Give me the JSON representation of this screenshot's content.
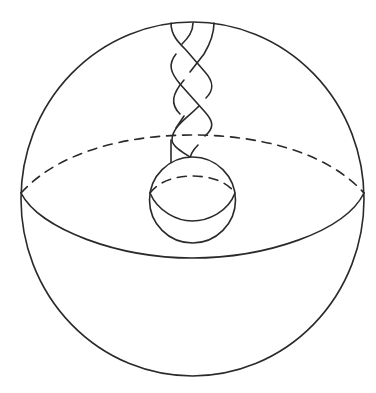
{
  "figure": {
    "colors": {
      "stroke": "#2a2a2a",
      "background": "#ffffff"
    },
    "outer_sphere": {
      "cx": 192.5,
      "cy": 199,
      "rx": 171.5,
      "ry": 177,
      "equator_y": 193,
      "front_dip_y": 258,
      "back_peak_y": 135
    },
    "inner_sphere": {
      "cx": 192.5,
      "cy": 200,
      "r": 43,
      "equator_y": 193,
      "front_dip_y": 221,
      "back_peak_y": 176
    },
    "braid": {
      "strand_count": 3,
      "top_x": [
        171,
        193,
        214
      ],
      "top_y": 23,
      "bottom_y": 160
    }
  }
}
